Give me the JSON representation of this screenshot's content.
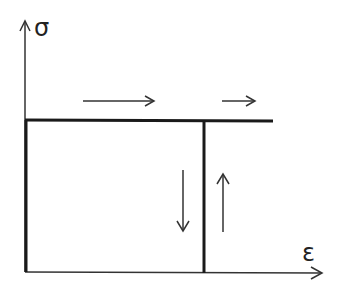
{
  "diagram": {
    "type": "stress-strain idealized (rigid-perfectly plastic loading/unloading)",
    "y_axis_label": "σ",
    "x_axis_label": "ε",
    "colors": {
      "line": "#222222",
      "background": "#ffffff"
    },
    "elements": {
      "yield_plateau": "horizontal line at yield stress",
      "unloading_line": "vertical line",
      "arrows": [
        "right",
        "right",
        "down",
        "up"
      ]
    }
  }
}
